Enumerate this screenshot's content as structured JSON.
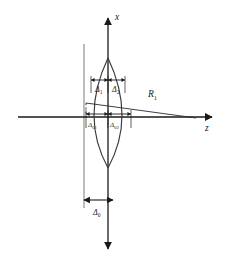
{
  "figure": {
    "axes": {
      "vertical_label": "x",
      "horizontal_label": "z"
    },
    "labels": {
      "radius": "R",
      "radius_sub": "1",
      "delta1": "Δ",
      "delta1_sub": "1",
      "delta2": "Δ",
      "delta2_sub": "2",
      "delta01": "Δ",
      "delta01_sub": "01",
      "delta02": "Δ",
      "delta02_sub": "02",
      "delta0": "Δ",
      "delta0_sub": "0"
    },
    "colors": {
      "axis": "#1a1a1a",
      "lens_outline": "#3a3a3a",
      "reference_line": "#8a8a8a",
      "dashed": "#2a2a2a",
      "radius_line": "#2a2a2a",
      "text": "#1a1a1a"
    },
    "geometry": {
      "origin_x": 108,
      "origin_y": 117,
      "lens_top_y": 58,
      "lens_bottom_y": 168,
      "lens_left_x": 84,
      "lens_right_x": 131,
      "reference_line_x": 84,
      "z_axis_end_x": 214,
      "x_axis_top_y": 14,
      "x_axis_bottom_y": 252,
      "radius_end_x": 196,
      "radius_end_y": 118,
      "upper_arrow_y": 80,
      "lower_arrow_y": 114,
      "bottom_arrow_y": 200
    }
  }
}
